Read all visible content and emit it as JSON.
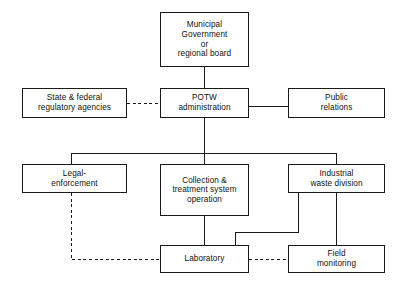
{
  "diagram": {
    "type": "organizational-flow-chart",
    "canvas": {
      "width": 407,
      "height": 289
    },
    "style": {
      "background_color": "#ffffff",
      "box_border_color": "#1a1a1a",
      "connector_solid_color": "#1a1a1a",
      "connector_dashed_color": "#1a1a1a",
      "text_color": "#101010"
    },
    "nodes": [
      {
        "id": "municipal-government",
        "label": "Municipal\nGovernment\nor\nregional board",
        "x": 160,
        "y": 12,
        "w": 89,
        "h": 55,
        "level": 0
      },
      {
        "id": "state-federal-regulatory-agencies",
        "label": "State & federal\nregulatory agencies",
        "x": 22,
        "y": 88,
        "w": 105,
        "h": 30,
        "level": 1
      },
      {
        "id": "potw-administration",
        "label": "POTW\nadministration",
        "x": 160,
        "y": 88,
        "w": 89,
        "h": 30,
        "level": 1
      },
      {
        "id": "public-relations",
        "label": "Public\nrelations",
        "x": 288,
        "y": 88,
        "w": 97,
        "h": 30,
        "level": 1
      },
      {
        "id": "legal-enforcement",
        "label": "Legal-\nenforcement",
        "x": 22,
        "y": 164,
        "w": 105,
        "h": 29,
        "level": 2
      },
      {
        "id": "collection-treatment-system-operation",
        "label": "Collection &\ntreatment system\noperation",
        "x": 160,
        "y": 164,
        "w": 89,
        "h": 52,
        "level": 2
      },
      {
        "id": "industrial-waste-division",
        "label": "Industrial\nwaste division",
        "x": 288,
        "y": 164,
        "w": 97,
        "h": 29,
        "level": 2
      },
      {
        "id": "laboratory",
        "label": "Laboratory",
        "x": 160,
        "y": 245,
        "w": 89,
        "h": 28,
        "level": 3
      },
      {
        "id": "field-monitoring",
        "label": "Field\nmonitoring",
        "x": 288,
        "y": 245,
        "w": 97,
        "h": 28,
        "level": 3
      }
    ],
    "connectors": [
      {
        "id": "municipal-to-potw",
        "from": "municipal-government",
        "to": "potw-administration",
        "line_style": "solid",
        "path": "M 204.5 67 L 204.5 88"
      },
      {
        "id": "regulatory-to-potw",
        "from": "state-federal-regulatory-agencies",
        "to": "potw-administration",
        "line_style": "dashed",
        "path": "M 127 103 L 160 103"
      },
      {
        "id": "potw-to-public-relations",
        "from": "potw-administration",
        "to": "public-relations",
        "line_style": "solid",
        "path": "M 249 106 L 288 106"
      },
      {
        "id": "potw-to-division-bus",
        "from": "potw-administration",
        "to": "division-bus",
        "line_style": "solid",
        "path": "M 204.5 118 L 204.5 153"
      },
      {
        "id": "division-bus-horizontal",
        "from": "division-bus",
        "to": "division-children",
        "line_style": "solid",
        "path": "M 71 153 L 336 153"
      },
      {
        "id": "bus-to-legal-enforcement",
        "from": "division-bus",
        "to": "legal-enforcement",
        "line_style": "solid",
        "path": "M 71 153 L 71 164"
      },
      {
        "id": "bus-to-collection-treatment",
        "from": "division-bus",
        "to": "collection-treatment-system-operation",
        "line_style": "solid",
        "path": "M 204.5 153 L 204.5 164"
      },
      {
        "id": "bus-to-industrial-waste",
        "from": "division-bus",
        "to": "industrial-waste-division",
        "line_style": "solid",
        "path": "M 336 153 L 336 164"
      },
      {
        "id": "collection-to-laboratory",
        "from": "collection-treatment-system-operation",
        "to": "laboratory",
        "line_style": "solid",
        "path": "M 204.5 216 L 204.5 245"
      },
      {
        "id": "industrial-to-laboratory",
        "from": "industrial-waste-division",
        "to": "laboratory",
        "line_style": "solid",
        "path": "M 298 193 L 298 232 L 235 232 L 235 245"
      },
      {
        "id": "industrial-to-field-monitoring",
        "from": "industrial-waste-division",
        "to": "field-monitoring",
        "line_style": "solid",
        "path": "M 336 193 L 336 245"
      },
      {
        "id": "legal-enforcement-to-laboratory",
        "from": "legal-enforcement",
        "to": "laboratory",
        "line_style": "dashed",
        "path": "M 71 193 L 71 259 L 160 259"
      },
      {
        "id": "laboratory-to-field-monitoring",
        "from": "laboratory",
        "to": "field-monitoring",
        "line_style": "dashed",
        "path": "M 249 259 L 288 259"
      }
    ]
  }
}
